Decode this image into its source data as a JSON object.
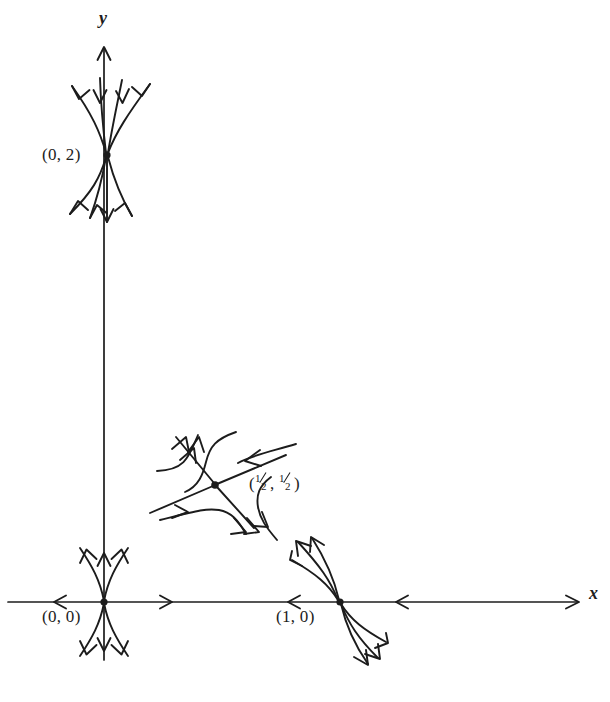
{
  "figure": {
    "kind": "phase-portrait",
    "background_color": "#ffffff",
    "stroke_color": "#1c1c1c",
    "width": 610,
    "height": 702,
    "axes": {
      "x_label": "x",
      "y_label": "y",
      "origin_px": [
        104,
        602
      ],
      "x_axis": {
        "from_px": [
          6,
          602
        ],
        "to_px": [
          578,
          602
        ],
        "arrow_at": "right"
      },
      "y_axis": {
        "from_px": [
          104,
          660
        ],
        "to_px": [
          104,
          45
        ],
        "arrow_at": "top"
      }
    },
    "equilibria": [
      {
        "id": "origin",
        "label": "(0, 0)",
        "label_kind": "plain",
        "position_px": [
          104,
          602
        ],
        "type": "saddle",
        "label_offset_px": [
          -62,
          14
        ],
        "description": "unstable along vertical axis, stable along horizontal axis"
      },
      {
        "id": "zero-two",
        "label": "(0, 2)",
        "label_kind": "plain",
        "position_px": [
          107,
          155
        ],
        "type": "stable-node",
        "label_offset_px": [
          -60,
          -11
        ],
        "description": "all nearby trajectories flow inward"
      },
      {
        "id": "one-zero",
        "label": "(1, 0)",
        "label_kind": "plain",
        "position_px": [
          340,
          602
        ],
        "type": "saddle",
        "label_offset_px": [
          -64,
          14
        ],
        "description": "stable along horizontal axis, unstable along steep diagonal"
      },
      {
        "id": "half-half",
        "label": "(½, ½)",
        "label_kind": "fraction",
        "label_parts": {
          "open": "(",
          "first_num": "1",
          "first_den": "2",
          "comma": ", ",
          "second_num": "1",
          "second_den": "2",
          "close": ")"
        },
        "position_px": [
          215,
          485
        ],
        "type": "saddle",
        "label_offset_px": [
          24,
          -12
        ],
        "description": "stable manifold along shallow NE-SW line, unstable manifold along steep NW-SE line"
      }
    ]
  }
}
